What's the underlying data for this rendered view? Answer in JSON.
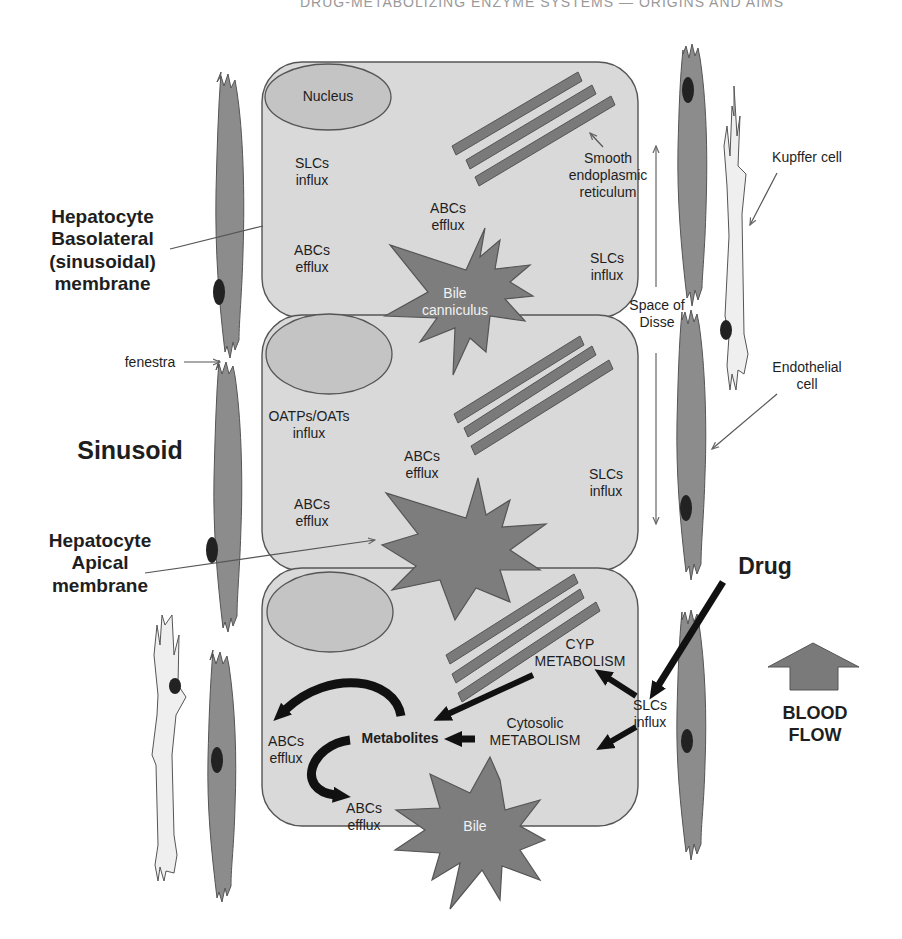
{
  "header": {
    "running_head": "DRUG-METABOLIZING ENZYME SYSTEMS — ORIGINS AND AIMS"
  },
  "colors": {
    "hepatocyte_fill": "#d9d9d9",
    "nucleus_fill": "#c4c4c4",
    "er_fill": "#7a7a7a",
    "bile_fill": "#7d7d7d",
    "endothelial_fill": "#8c8c8c",
    "kupffer_fill": "#efefef",
    "outline": "#555555",
    "text": "#1e1e1e",
    "arrow_black": "#111111",
    "blood_flow_arrow": "#7a7a7a"
  },
  "left_labels": {
    "basolateral": "Hepatocyte\nBasolateral\n(sinusoidal)\nmembrane",
    "fenestra": "fenestra",
    "sinusoid": "Sinusoid",
    "apical": "Hepatocyte\nApical\nmembrane"
  },
  "right_labels": {
    "kupffer": "Kupffer cell",
    "space_of_disse": "Space of\nDisse",
    "endothelial": "Endothelial\ncell",
    "drug": "Drug",
    "blood_flow": "BLOOD\nFLOW"
  },
  "cell1": {
    "nucleus": "Nucleus",
    "slcs_influx_left": "SLCs\ninflux",
    "abcs_efflux_left": "ABCs\nefflux",
    "abcs_efflux_center": "ABCs\nefflux",
    "ser": "Smooth\nendoplasmic\nreticulum",
    "slcs_influx_right": "SLCs\ninflux",
    "bile": "Bile\ncanniculus"
  },
  "cell2": {
    "oatps": "OATPs/OATs\ninflux",
    "abcs_efflux_center": "ABCs\nefflux",
    "abcs_efflux_left": "ABCs\nefflux",
    "slcs_influx_right": "SLCs\ninflux"
  },
  "cell3": {
    "cyp": "CYP\nMETABOLISM",
    "slcs_influx": "SLCs\ninflux",
    "cytosolic": "Cytosolic\nMETABOLISM",
    "metabolites": "Metabolites",
    "abcs_efflux_left": "ABCs\nefflux",
    "abcs_efflux_bottom": "ABCs\nefflux",
    "bile": "Bile"
  }
}
